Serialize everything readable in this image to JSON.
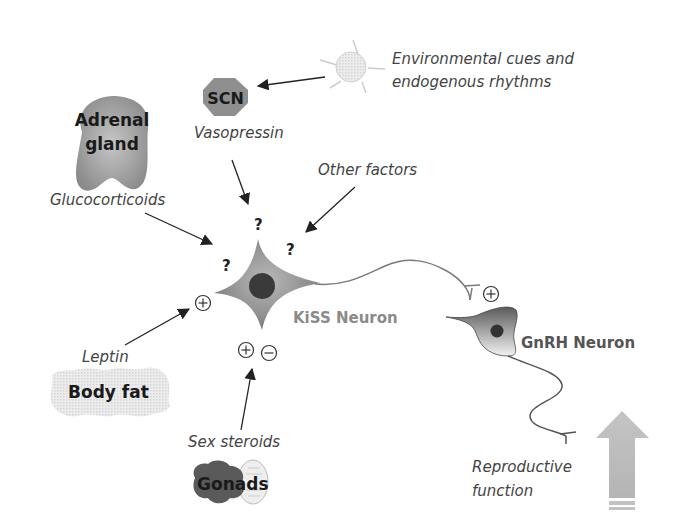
{
  "inputs": {
    "environment": {
      "label_line1": "Environmental cues and",
      "label_line2": "endogenous rhythms",
      "icon": "sun-icon"
    },
    "scn": {
      "label": "SCN",
      "signal": "Vasopressin",
      "shape": "octagon"
    },
    "adrenal": {
      "label_line1": "Adrenal",
      "label_line2": "gland",
      "signal": "Glucocorticoids"
    },
    "other": {
      "signal": "Other factors"
    },
    "body_fat": {
      "label": "Body fat",
      "signal": "Leptin"
    },
    "gonads": {
      "label": "Gonads",
      "signal": "Sex steroids"
    }
  },
  "neurons": {
    "kiss": {
      "label": "KiSS Neuron"
    },
    "gnrh": {
      "label": "GnRH Neuron"
    }
  },
  "markers": {
    "unknown": "?",
    "plus": "+",
    "minus": "−"
  },
  "output": {
    "label_line1": "Reproductive",
    "label_line2": "function",
    "direction": "up-arrow"
  },
  "colors": {
    "neuron_gray": "#8a8a8a",
    "nucleus": "#3a3a3a",
    "label_gray": "#7a7a7a",
    "arrow": "#222222",
    "light_fill": "#d9d9d9"
  }
}
